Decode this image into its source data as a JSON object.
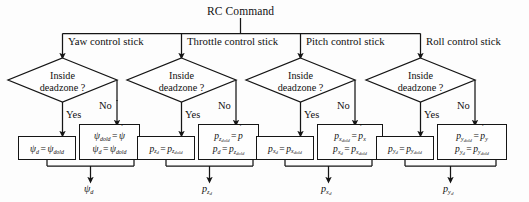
{
  "diagram": {
    "type": "flowchart",
    "title_node": "RC Command",
    "branch_labels": [
      "Yaw control stick",
      "Throttle control stick",
      "Pitch control stick",
      "Roll control stick"
    ],
    "decision_text_line1": "Inside",
    "decision_text_line2": "deadzone ?",
    "edge_yes": "Yes",
    "edge_no": "No",
    "columns": [
      {
        "id": "yaw",
        "branch": "Yaw control stick",
        "yes_box": {
          "lines": [
            "psi_d = psi_dold"
          ]
        },
        "no_box": {
          "lines": [
            "psi_dold = psi_dot_hat",
            "psi_d = psi_dold"
          ]
        },
        "output": "psi_d"
      },
      {
        "id": "throttle",
        "branch": "Throttle control stick",
        "yes_box": {
          "lines": [
            "p_zd = p_zdold"
          ]
        },
        "no_box": {
          "lines": [
            "p_zdold = p_dot",
            "p_d = p_zdold"
          ]
        },
        "output": "p_zd"
      },
      {
        "id": "pitch",
        "branch": "Pitch control stick",
        "yes_box": {
          "lines": [
            "p_xd = p_xdold"
          ]
        },
        "no_box": {
          "lines": [
            "p_xdold = p_dot_x",
            "p_xd = p_xdold"
          ]
        },
        "output": "p_xd"
      },
      {
        "id": "roll",
        "branch": "Roll control stick",
        "yes_box": {
          "lines": [
            "p_yd = p_ydold"
          ]
        },
        "no_box": {
          "lines": [
            "p_ydold = p_dot_y",
            "p_yd = p_ydold"
          ]
        },
        "output": "p_yd"
      }
    ],
    "colors": {
      "stroke": "#151515",
      "text": "#111111",
      "background": "#fdfdfd",
      "box_fill": "#fefefe"
    }
  }
}
